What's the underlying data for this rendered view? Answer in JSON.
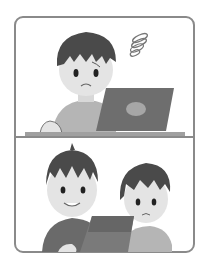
{
  "illustration": {
    "style": "grayscale two-panel comic",
    "panels": [
      {
        "name": "top-panel",
        "description": "worried boy looking at laptop with dizzy spiral above head"
      },
      {
        "name": "bottom-panel",
        "description": "smiling boy helping worried boy with laptop"
      }
    ],
    "colors": {
      "frame": "#8a8a8a",
      "hair": "#4a4a4a",
      "skin": "#e4e4e4",
      "shirt_light": "#b5b5b5",
      "shirt_dark": "#6a6a6a",
      "laptop": "#6e6e6e",
      "laptop_logo": "#a6a6a6",
      "desk": "#a0a0a0"
    }
  }
}
